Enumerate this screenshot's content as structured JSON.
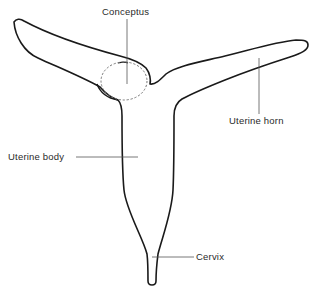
{
  "diagram": {
    "labels": {
      "conceptus": "Conceptus",
      "uterine_horn": "Uterine horn",
      "uterine_body": "Uterine body",
      "cervix": "Cervix"
    },
    "colors": {
      "outline": "#1a1a1a",
      "leader": "#555555",
      "conceptus_dash": "#777777",
      "background": "#ffffff"
    }
  }
}
